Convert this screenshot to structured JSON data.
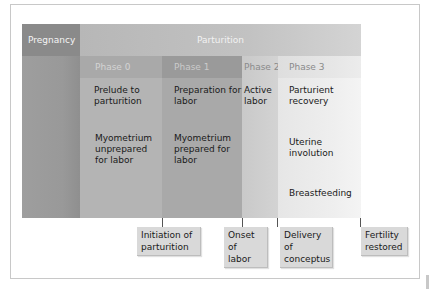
{
  "diagram": {
    "header": {
      "pregnancy": "Pregnancy",
      "parturition": "Parturition"
    },
    "phases": [
      {
        "label": "Phase 0",
        "lines": [
          "Prelude to parturition",
          "Myometrium unprepared for labor"
        ]
      },
      {
        "label": "Phase 1",
        "lines": [
          "Preparation for labor",
          "Myometrium prepared for labor"
        ]
      },
      {
        "label": "Phase 2",
        "lines": [
          "Active labor"
        ]
      },
      {
        "label": "Phase 3",
        "lines": [
          "Parturient recovery",
          "Uterine involution",
          "Breastfeeding"
        ]
      }
    ],
    "events": [
      {
        "label": "Initiation of parturition"
      },
      {
        "label": "Onset of labor"
      },
      {
        "label": "Delivery of conceptus"
      },
      {
        "label": "Fertility restored"
      }
    ],
    "colors": {
      "pregnancy_header": "#8a8a8a",
      "pregnancy_body": "#9c9c9c",
      "parturition_header": "#bdbdbd",
      "phase0_header": "#a9a9a9",
      "phase0_body": "#b3b3b3",
      "phase1_header": "#9a9a9a",
      "phase1_body": "#a8a8a8",
      "phase2": "#cdcdcd",
      "phase3": "#ececec",
      "label_box": "#d9d9d9"
    }
  }
}
